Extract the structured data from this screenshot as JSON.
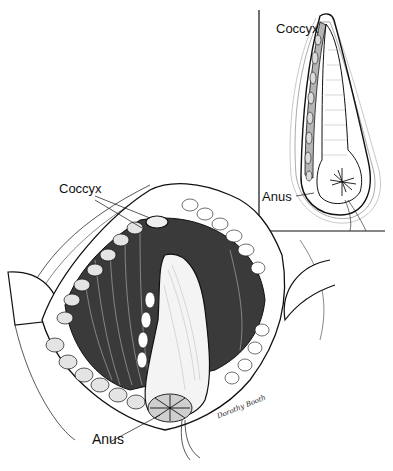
{
  "figure": {
    "type": "surgical illustration",
    "style": "black ink line drawing",
    "colors": {
      "background": "#ffffff",
      "ink": "#111111"
    }
  },
  "inset": {
    "labels": {
      "coccyx": "Coccyx",
      "anus": "Anus"
    }
  },
  "main_view": {
    "labels": {
      "coccyx": "Coccyx",
      "anus": "Anus"
    }
  },
  "signature": "Dorothy Booth"
}
